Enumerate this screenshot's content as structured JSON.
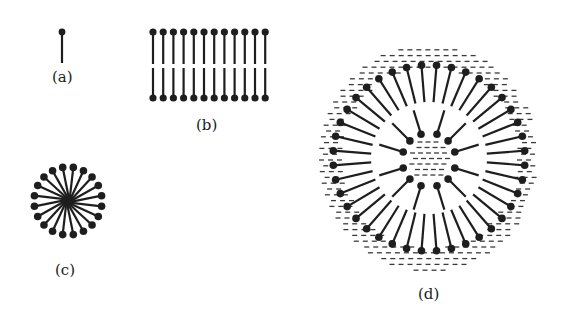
{
  "figure": {
    "labels": {
      "a": "(a)",
      "b": "(b)",
      "c": "(c)",
      "d": "(d)"
    },
    "panels": [
      {
        "id": "a",
        "name": "single lipid molecule",
        "count": 1
      },
      {
        "id": "b",
        "name": "lipid bilayer",
        "lipids_per_layer": 12
      },
      {
        "id": "c",
        "name": "micelle",
        "head_count": 20
      },
      {
        "id": "d",
        "name": "liposome",
        "outer_head_count": 40,
        "inner_head_count": 12
      }
    ],
    "colors": {
      "ink": "#1e1e1e",
      "background": "#ffffff",
      "water_dash": "#3a3a3a"
    }
  }
}
